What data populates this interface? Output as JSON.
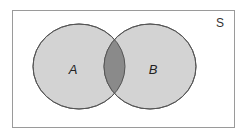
{
  "diagram": {
    "type": "venn",
    "universe": {
      "label": "S",
      "border_color": "#9a9a9a",
      "background": "#ffffff"
    },
    "sets": [
      {
        "id": "A",
        "label": "A",
        "fill": "#d3d3d3",
        "stroke": "#555555"
      },
      {
        "id": "B",
        "label": "B",
        "fill": "#d3d3d3",
        "stroke": "#555555"
      }
    ],
    "intersection": {
      "sets": [
        "A",
        "B"
      ],
      "fill": "#8a8a8a",
      "highlighted": true
    }
  }
}
